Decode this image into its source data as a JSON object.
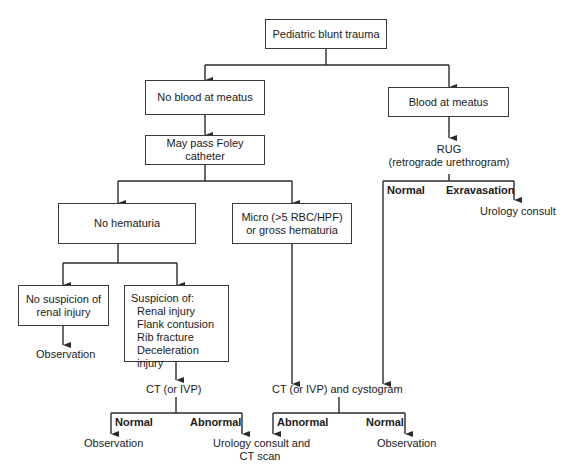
{
  "diagram": {
    "type": "flowchart",
    "nodes": {
      "root": "Pediatric blunt trauma",
      "no_blood": "No blood at meatus",
      "blood": "Blood at meatus",
      "foley": "May pass Foley catheter",
      "rug": {
        "line1": "RUG",
        "line2": "(retrograde urethrogram)"
      },
      "rug_normal": "Normal",
      "rug_extravasation": "Exravasation",
      "rug_urology": "Urology consult",
      "no_hematuria": "No hematuria",
      "micro": {
        "line1": "Micro (>5 RBC/HPF)",
        "line2": "or gross hematuria"
      },
      "no_suspicion": {
        "line1": "No suspicion of",
        "line2": "renal injury"
      },
      "no_suspicion_obs": "Observation",
      "suspicion": {
        "title": "Suspicion of:",
        "items": [
          "Renal injury",
          "Flank contusion",
          "Rib fracture",
          "Deceleration injury"
        ]
      },
      "ct": "CT (or IVP)",
      "ct_normal": "Normal",
      "ct_abnormal": "Abnormal",
      "ct_normal_obs": "Observation",
      "urology_ct": {
        "line1": "Urology consult and",
        "line2": "CT scan"
      },
      "ct_cysto": "CT (or IVP) and cystogram",
      "cysto_abnormal": "Abnormal",
      "cysto_normal": "Normal",
      "cysto_normal_obs": "Observation"
    },
    "colors": {
      "line": "#2a2a2a",
      "text": "#1a1a1a",
      "background": "#ffffff"
    }
  }
}
